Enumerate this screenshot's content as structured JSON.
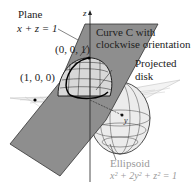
{
  "labels": {
    "plane_title": "Plane",
    "plane_eq": "x + z = 1",
    "curve_line1": "Curve C with",
    "curve_line2": "clockwise orientation",
    "projected_line1": "Projected",
    "projected_line2": "disk",
    "point_001": "(0, 0, 1)",
    "point_100": "(1, 0, 0)",
    "ellipsoid_title": "Ellipsoid",
    "ellipsoid_eq": "x² + 2y² + z² = 1",
    "axis_z": "z",
    "axis_y": "y"
  },
  "colors": {
    "plane_fill": "#8c8c8c",
    "plane_stroke": "#3a3a3a",
    "xy_plane_fill": "#f2f2f2",
    "grid_line": "#222222",
    "ellipsoid_fill": "#e8e8e8",
    "ellipsoid_label": "#9a9a9a"
  }
}
